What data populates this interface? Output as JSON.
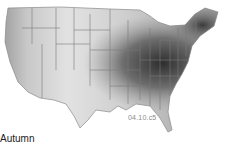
{
  "map": {
    "subject": "Contiguous United States shaded choropleth",
    "season_label": "Autumn",
    "figure_code": "04.10.c5",
    "colors": {
      "lightest": "#e6e6e6",
      "light": "#cfcfcf",
      "mid": "#a8a8a8",
      "dark": "#6e6e6e",
      "darkest": "#2e2e2e",
      "borders": "#7a7a7a"
    }
  }
}
